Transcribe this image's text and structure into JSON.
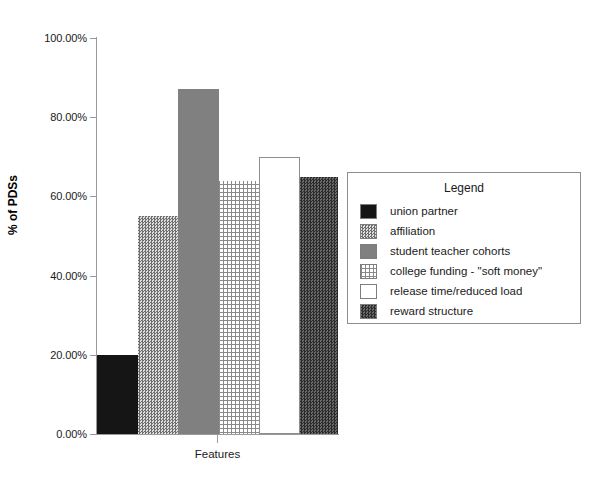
{
  "chart_data": {
    "type": "bar",
    "title": "",
    "xlabel": "Features",
    "ylabel": "% of PDSs",
    "categories": [
      "union partner",
      "affiliation",
      "student teacher cohorts",
      "college funding - \"soft money\"",
      "release time/reduced load",
      "reward structure"
    ],
    "values": [
      20.0,
      55.0,
      87.0,
      64.0,
      70.0,
      65.0
    ],
    "value_labels": [
      "20.00%",
      "55.00%",
      "87.00%",
      "64.00%",
      "70.00%",
      "65.00%"
    ],
    "ylim": [
      0,
      100
    ],
    "ytick_values": [
      0,
      20,
      40,
      60,
      80,
      100
    ],
    "ytick_labels": [
      "0.00%",
      "20.00%",
      "40.00%",
      "60.00%",
      "80.00%",
      "100.00%"
    ],
    "xtick_labels": [
      ""
    ],
    "grid": false,
    "legend_position": "right",
    "legend_title": "Legend",
    "series_styles": [
      {
        "name": "union partner",
        "fill": "solid-black",
        "color": "#151515"
      },
      {
        "name": "affiliation",
        "fill": "check-mid",
        "color": "#a8a8a8"
      },
      {
        "name": "student teacher cohorts",
        "fill": "solid-gray",
        "color": "#808080"
      },
      {
        "name": "college funding - \"soft money\"",
        "fill": "brick",
        "color": "#b4b4b4"
      },
      {
        "name": "release time/reduced load",
        "fill": "white",
        "color": "#ffffff"
      },
      {
        "name": "reward structure",
        "fill": "check-dark",
        "color": "#4a4a4a"
      }
    ]
  },
  "axes": {
    "y_label": "% of PDSs",
    "x_label": "Features",
    "y_ticks": [
      "100.00%",
      "80.00%",
      "60.00%",
      "40.00%",
      "20.00%",
      "0.00%"
    ]
  },
  "legend": {
    "title": "Legend",
    "items": [
      {
        "label": "union partner"
      },
      {
        "label": "affiliation"
      },
      {
        "label": "student teacher cohorts"
      },
      {
        "label": "college funding - \"soft money\""
      },
      {
        "label": "release time/reduced load"
      },
      {
        "label": "reward structure"
      }
    ]
  }
}
